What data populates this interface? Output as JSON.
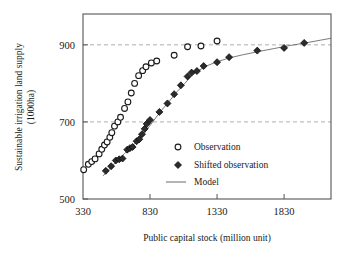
{
  "chart_data": {
    "type": "scatter",
    "title": "",
    "xlabel": "Public capital stock (million unit)",
    "ylabel": "Sustainable irrigation land supply (1000ha)",
    "ylabel_line1": "Sustainable irrigation land supply",
    "ylabel_line2": "(1000ha)",
    "xlim": [
      330,
      2180
    ],
    "ylim": [
      500,
      980
    ],
    "xticks": [
      330,
      830,
      1330,
      1830
    ],
    "xtick_labels": [
      "330",
      "830",
      "1330",
      "1830"
    ],
    "yticks": [
      500,
      700,
      900
    ],
    "ytick_labels": [
      "500",
      "700",
      "900"
    ],
    "gridlines_y": [
      700,
      900
    ],
    "grid": "horizontal-dashed",
    "legend_position": "inside-lower-right",
    "legend": [
      {
        "label": "Observation",
        "marker": "open-circle"
      },
      {
        "label": "Shifted observation",
        "marker": "filled-diamond"
      },
      {
        "label": "Model",
        "marker": "line"
      }
    ],
    "series": [
      {
        "name": "Observation",
        "marker": "open-circle",
        "color": "#1a1a1a",
        "points": [
          [
            335,
            576
          ],
          [
            370,
            590
          ],
          [
            395,
            597
          ],
          [
            420,
            604
          ],
          [
            450,
            617
          ],
          [
            470,
            629
          ],
          [
            490,
            640
          ],
          [
            510,
            648
          ],
          [
            530,
            660
          ],
          [
            545,
            672
          ],
          [
            565,
            689
          ],
          [
            590,
            700
          ],
          [
            610,
            712
          ],
          [
            640,
            735
          ],
          [
            665,
            752
          ],
          [
            690,
            775
          ],
          [
            715,
            800
          ],
          [
            745,
            820
          ],
          [
            775,
            833
          ],
          [
            800,
            843
          ],
          [
            840,
            853
          ],
          [
            880,
            858
          ],
          [
            1010,
            873
          ],
          [
            1110,
            895
          ],
          [
            1210,
            897
          ],
          [
            1330,
            910
          ]
        ]
      },
      {
        "name": "Shifted observation",
        "marker": "filled-diamond",
        "color": "#2b2b2b",
        "points": [
          [
            500,
            573
          ],
          [
            540,
            585
          ],
          [
            575,
            600
          ],
          [
            600,
            603
          ],
          [
            625,
            605
          ],
          [
            660,
            628
          ],
          [
            680,
            632
          ],
          [
            700,
            635
          ],
          [
            730,
            650
          ],
          [
            750,
            655
          ],
          [
            770,
            668
          ],
          [
            790,
            682
          ],
          [
            805,
            695
          ],
          [
            830,
            705
          ],
          [
            900,
            726
          ],
          [
            960,
            748
          ],
          [
            1010,
            772
          ],
          [
            1060,
            795
          ],
          [
            1110,
            818
          ],
          [
            1140,
            828
          ],
          [
            1180,
            832
          ],
          [
            1230,
            845
          ],
          [
            1330,
            855
          ],
          [
            1420,
            868
          ],
          [
            1630,
            885
          ],
          [
            1830,
            892
          ],
          [
            1980,
            905
          ]
        ]
      }
    ],
    "model_line": {
      "name": "Model",
      "color": "#6b6b6b",
      "points": [
        [
          480,
          560
        ],
        [
          560,
          590
        ],
        [
          640,
          618
        ],
        [
          720,
          645
        ],
        [
          790,
          672
        ],
        [
          850,
          700
        ],
        [
          910,
          728
        ],
        [
          970,
          752
        ],
        [
          1030,
          778
        ],
        [
          1090,
          800
        ],
        [
          1140,
          820
        ],
        [
          1190,
          833
        ],
        [
          1250,
          845
        ],
        [
          1330,
          856
        ],
        [
          1420,
          866
        ],
        [
          1520,
          874
        ],
        [
          1630,
          882
        ],
        [
          1750,
          890
        ],
        [
          1870,
          898
        ],
        [
          1990,
          905
        ],
        [
          2100,
          912
        ],
        [
          2180,
          917
        ]
      ]
    }
  }
}
